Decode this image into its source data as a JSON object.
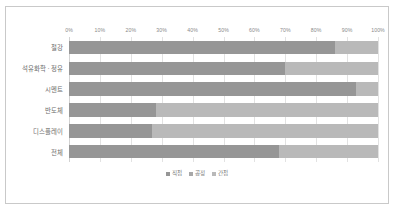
{
  "chart_data": {
    "type": "bar",
    "orientation": "horizontal",
    "stacked": true,
    "stack_mode": "percent",
    "title": "",
    "xlabel": "",
    "ylabel": "",
    "xlim": [
      0,
      100
    ],
    "grid": true,
    "legend_position": "bottom",
    "categories": [
      "철강",
      "석유화학 · 정유",
      "시멘트",
      "반도체",
      "디스플레이",
      "전체"
    ],
    "tick_labels": [
      "0%",
      "10%",
      "20%",
      "30%",
      "40%",
      "50%",
      "60%",
      "70%",
      "80%",
      "90%",
      "100%"
    ],
    "tick_values": [
      0,
      10,
      20,
      30,
      40,
      50,
      60,
      70,
      80,
      90,
      100
    ],
    "legend": [
      "직접",
      "공정",
      "간접"
    ],
    "series": [
      {
        "name": "직접",
        "color": "#969696",
        "values": [
          86,
          70,
          93,
          28,
          27,
          68
        ]
      },
      {
        "name": "공정",
        "color": "#a8a8a8",
        "values": [
          0,
          0,
          0,
          0,
          0,
          0
        ]
      },
      {
        "name": "간접",
        "color": "#b9b9b9",
        "values": [
          14,
          30,
          7,
          72,
          73,
          32
        ]
      }
    ],
    "colors": {
      "direct": "#969696",
      "process": "#a8a8a8",
      "indirect": "#b9b9b9",
      "gridline": "#e2e2e2",
      "axis_text": "#8a8a8a",
      "label_text": "#6d6d6d",
      "frame": "#c9c9c9",
      "background": "#ffffff"
    }
  }
}
